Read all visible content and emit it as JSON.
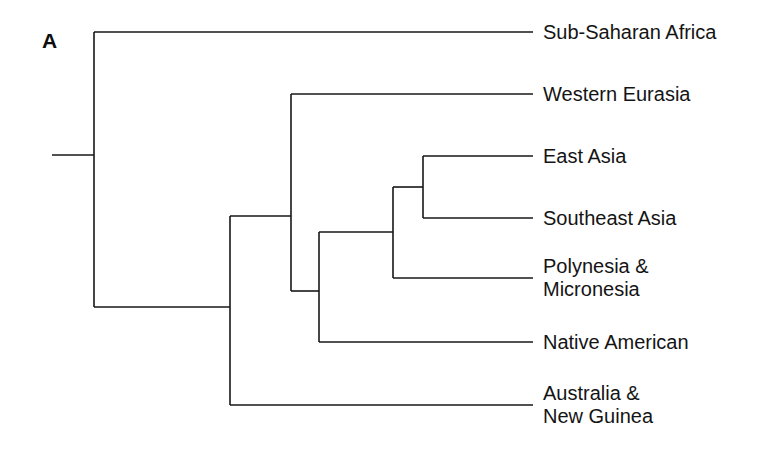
{
  "figure": {
    "panel_label": "A",
    "panel_label_x": 42,
    "panel_label_y": 30,
    "background_color": "#ffffff",
    "line_color": "#171717",
    "text_color": "#141414"
  },
  "chart_data": {
    "type": "diagram",
    "diagram_type": "phylogenetic-tree-cladogram",
    "title": "A",
    "orientation": "left-to-right",
    "grid": false,
    "legend": false,
    "axis": "none",
    "tips": [
      {
        "id": "sub-saharan-africa",
        "label": "Sub-Saharan Africa",
        "lines": [
          "Sub-Saharan Africa"
        ],
        "y": 32,
        "branch_x_start": 94,
        "branch_x_end": 533,
        "label_x": 543,
        "label_y": 32
      },
      {
        "id": "western-eurasia",
        "label": "Western Eurasia",
        "lines": [
          "Western Eurasia"
        ],
        "y": 94,
        "branch_x_start": 291,
        "branch_x_end": 533,
        "label_x": 543,
        "label_y": 94
      },
      {
        "id": "east-asia",
        "label": "East Asia",
        "lines": [
          "East Asia"
        ],
        "y": 156,
        "branch_x_start": 423,
        "branch_x_end": 533,
        "label_x": 543,
        "label_y": 156
      },
      {
        "id": "southeast-asia",
        "label": "Southeast Asia",
        "lines": [
          "Southeast Asia"
        ],
        "y": 218,
        "branch_x_start": 423,
        "branch_x_end": 533,
        "label_x": 543,
        "label_y": 218
      },
      {
        "id": "polynesia-micronesia",
        "label": "Polynesia & Micronesia",
        "lines": [
          "Polynesia &",
          "Micronesia"
        ],
        "y": 278,
        "branch_x_start": 393,
        "branch_x_end": 533,
        "label_x": 543,
        "label_y": 278
      },
      {
        "id": "native-american",
        "label": "Native American",
        "lines": [
          "Native American"
        ],
        "y": 342,
        "branch_x_start": 319,
        "branch_x_end": 533,
        "label_x": 543,
        "label_y": 342
      },
      {
        "id": "australia-new-guinea",
        "label": "Australia & New Guinea",
        "lines": [
          "Australia &",
          "New Guinea"
        ],
        "y": 405,
        "branch_x_start": 230,
        "branch_x_end": 533,
        "label_x": 543,
        "label_y": 405
      }
    ],
    "internal_nodes": [
      {
        "id": "root",
        "x": 94,
        "child_y_top": 32,
        "child_y_bottom": 307,
        "parent_x": 52,
        "parent_y": 155,
        "children": [
          "sub-saharan-africa",
          "node-non-african"
        ]
      },
      {
        "id": "node-non-african",
        "x": 230,
        "child_y_top": 216,
        "child_y_bottom": 405,
        "parent_x": 94,
        "parent_y": 307,
        "children": [
          "node-eurasia-america",
          "australia-new-guinea"
        ]
      },
      {
        "id": "node-eurasia-america",
        "x": 291,
        "child_y_top": 94,
        "child_y_bottom": 291,
        "parent_x": 230,
        "parent_y": 216,
        "children": [
          "western-eurasia",
          "node-asia-america"
        ]
      },
      {
        "id": "node-asia-america",
        "x": 319,
        "child_y_top": 232,
        "child_y_bottom": 342,
        "parent_x": 291,
        "parent_y": 291,
        "children": [
          "node-asia-pacific",
          "native-american"
        ]
      },
      {
        "id": "node-asia-pacific",
        "x": 393,
        "child_y_top": 187,
        "child_y_bottom": 278,
        "parent_x": 319,
        "parent_y": 232,
        "children": [
          "node-east-southeast-asia",
          "polynesia-micronesia"
        ]
      },
      {
        "id": "node-east-southeast-asia",
        "x": 423,
        "child_y_top": 156,
        "child_y_bottom": 218,
        "parent_x": 393,
        "parent_y": 187,
        "children": [
          "east-asia",
          "southeast-asia"
        ]
      }
    ]
  }
}
